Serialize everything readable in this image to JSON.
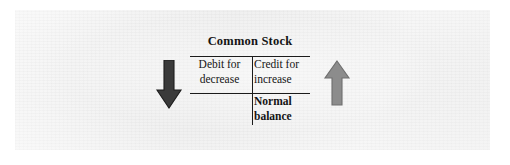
{
  "figure": {
    "type": "t-account-diagram",
    "account": {
      "title": "Common Stock",
      "debit_side": {
        "line1": "Debit for",
        "line2": "decrease"
      },
      "credit_side": {
        "line1": "Credit for",
        "line2": "increase"
      },
      "normal_balance": {
        "line1": "Normal",
        "line2": "balance"
      }
    },
    "arrows": [
      {
        "name": "decrease-arrow",
        "direction": "down",
        "side": "debit",
        "color": "#3a3a3a"
      },
      {
        "name": "increase-arrow",
        "direction": "up",
        "side": "credit",
        "color": "#8c8c8c"
      }
    ],
    "colors": {
      "ink": "#141414",
      "rule": "#1b1b1b",
      "paper": "#f2f2f2",
      "page": "#ffffff"
    }
  }
}
